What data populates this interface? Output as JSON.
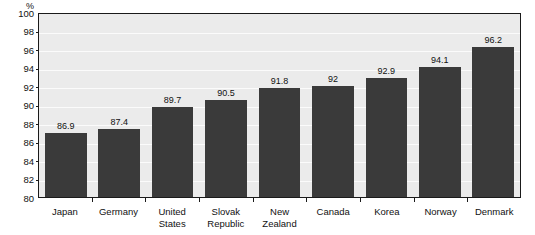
{
  "chart_data": {
    "type": "bar",
    "title": "",
    "subtitle": "",
    "xlabel": "",
    "ylabel": "%",
    "unit_label": "%",
    "ylim": [
      80,
      100
    ],
    "ytick_step": 2,
    "yticks": [
      100,
      98,
      96,
      94,
      92,
      90,
      88,
      86,
      84,
      82,
      80
    ],
    "ytick_labels": [
      "100",
      "98",
      "96",
      "94",
      "92",
      "90",
      "88",
      "86",
      "84",
      "82",
      "80"
    ],
    "grid": true,
    "legend": "none",
    "orientation": "vertical",
    "categories": [
      "Japan",
      "Germany",
      "United States",
      "Slovak\nRepublic",
      "New Zealand",
      "Canada",
      "Korea",
      "Norway",
      "Denmark"
    ],
    "values": [
      86.9,
      87.4,
      89.7,
      90.5,
      91.8,
      92,
      92.9,
      94.1,
      96.2
    ],
    "value_labels": [
      "86.9",
      "87.4",
      "89.7",
      "90.5",
      "91.8",
      "92",
      "92.9",
      "94.1",
      "96.2"
    ],
    "colors": {
      "bar_fill": "#3a3a3a",
      "plot_background": "#ebebeb",
      "gridline": "#fbfbfb",
      "axis": "#1a1a1a",
      "text": "#111111",
      "page_background": "#ffffff"
    }
  }
}
